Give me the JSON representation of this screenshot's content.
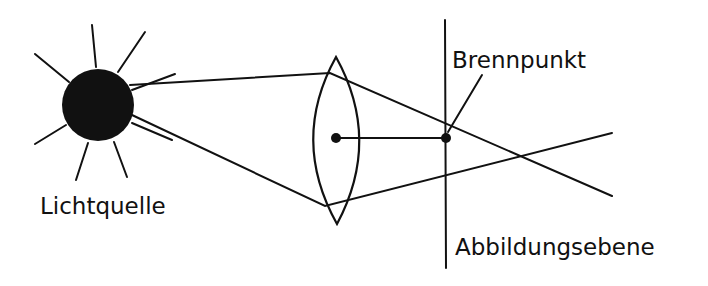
{
  "diagram": {
    "labels": {
      "light_source": "Lichtquelle",
      "focal_point": "Brennpunkt",
      "image_plane": "Abbildungsebene"
    },
    "colors": {
      "ink": "#111111",
      "background": "#ffffff"
    }
  }
}
